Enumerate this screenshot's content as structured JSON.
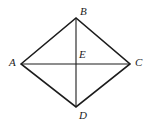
{
  "figure": {
    "name": "quadrilateral-abcd-with-diagonals",
    "background_color": "#ffffff",
    "stroke_color": "#1c1c1c",
    "outer_stroke_width": 1.6,
    "diagonal_stroke_width": 1.1,
    "labels": {
      "A": "A",
      "B": "B",
      "C": "C",
      "D": "D",
      "E": "E"
    },
    "points": {
      "A": {
        "x": 21,
        "y": 64
      },
      "B": {
        "x": 76,
        "y": 18
      },
      "C": {
        "x": 130,
        "y": 64
      },
      "D": {
        "x": 76,
        "y": 107
      },
      "E": {
        "x": 76,
        "y": 64
      }
    },
    "edges": [
      {
        "name": "edge-AB",
        "from": "A",
        "to": "B"
      },
      {
        "name": "edge-BC",
        "from": "B",
        "to": "C"
      },
      {
        "name": "edge-CD",
        "from": "C",
        "to": "D"
      },
      {
        "name": "edge-DA",
        "from": "D",
        "to": "A"
      }
    ],
    "diagonals": [
      {
        "name": "diagonal-AC",
        "from": "A",
        "to": "C"
      },
      {
        "name": "diagonal-BD",
        "from": "B",
        "to": "D"
      }
    ]
  }
}
